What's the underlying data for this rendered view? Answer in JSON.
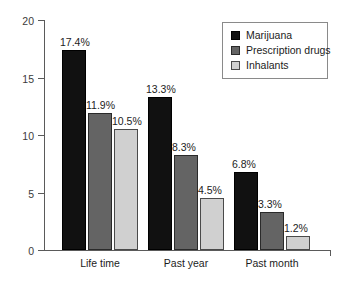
{
  "chart_data": {
    "type": "bar",
    "title": "",
    "xlabel": "",
    "ylabel": "",
    "ylim": [
      0,
      20
    ],
    "yticks": [
      0,
      5,
      10,
      15,
      20
    ],
    "grid": false,
    "legend_position": "top-right",
    "categories": [
      "Life time",
      "Past year",
      "Past month"
    ],
    "series": [
      {
        "name": "Marijuana",
        "color": "#111111",
        "values": [
          17.4,
          13.3,
          6.8
        ],
        "labels": [
          "17.4%",
          "13.3%",
          "6.8%"
        ]
      },
      {
        "name": "Prescription drugs",
        "color": "#646464",
        "values": [
          11.9,
          8.3,
          3.3
        ],
        "labels": [
          "11.9%",
          "8.3%",
          "3.3%"
        ]
      },
      {
        "name": "Inhalants",
        "color": "#d0d0d0",
        "values": [
          10.5,
          4.5,
          1.2
        ],
        "labels": [
          "10.5%",
          "4.5%",
          "1.2%"
        ]
      }
    ]
  },
  "axis": {
    "ytick_labels": [
      "0",
      "5",
      "10",
      "15",
      "20"
    ]
  },
  "legend": {
    "items": [
      {
        "label": "Marijuana"
      },
      {
        "label": "Prescription drugs"
      },
      {
        "label": "Inhalants"
      }
    ]
  }
}
